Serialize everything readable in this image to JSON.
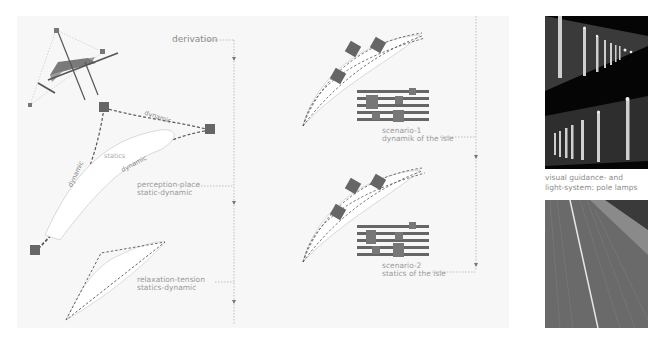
{
  "diagram": {
    "derivation_label": "derivation",
    "triangle": {
      "edge_top_label": "dynamic",
      "edge_left_label": "dynamic",
      "edge_inner_label": "dynamic",
      "inner_label": "statics"
    },
    "perception": {
      "line1": "perception-place",
      "line2": "static-dynamic"
    },
    "relaxation": {
      "line1": "relaxation-tension",
      "line2": "statics-dynamic"
    },
    "scenario1": {
      "line1": "scenario-1",
      "line2": "dynamik of the isle"
    },
    "scenario2": {
      "line1": "scenario-2",
      "line2": "statics of the isle"
    },
    "photos": {
      "caption_line1": "visual guidance- and",
      "caption_line2": "light-system: pole lamps",
      "photo1_subject": "night row of illuminated pole lamps",
      "photo2_subject": "paved promenade with light strip"
    },
    "colors": {
      "panel_bg": "#f7f7f7",
      "stroke_dark": "#555555",
      "square_fill": "#666666",
      "label_text": "#8a8a8a"
    }
  }
}
